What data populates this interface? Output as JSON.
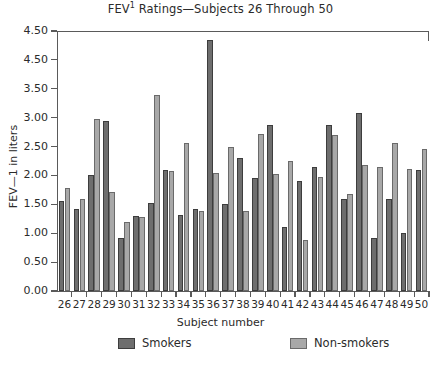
{
  "chart_data": {
    "type": "bar",
    "title_main": "FEV",
    "title_sup": "1",
    "title_rest": " Ratings—Subjects 26 Through 50",
    "xlabel": "Subject number",
    "ylabel": "FEV—1 in liters",
    "categories": [
      "26",
      "27",
      "28",
      "29",
      "30",
      "31",
      "32",
      "33",
      "34",
      "35",
      "36",
      "37",
      "38",
      "39",
      "40",
      "41",
      "42",
      "43",
      "44",
      "45",
      "46",
      "47",
      "48",
      "49",
      "50"
    ],
    "ylim": [
      0.0,
      4.5
    ],
    "ytick_values": [
      0.0,
      0.5,
      1.0,
      1.5,
      2.0,
      2.5,
      3.0,
      3.5,
      4.0,
      4.5
    ],
    "ytick_labels": [
      "0.00",
      "0.50",
      "1.00",
      "1.50",
      "2.00",
      "2.50",
      "3.00",
      "3.50",
      "4.50",
      "4.50"
    ],
    "grid": false,
    "legend_position": "bottom",
    "series": [
      {
        "name": "Smokers",
        "color": "#6e6e6e",
        "values": [
          1.55,
          1.42,
          2.0,
          2.95,
          0.92,
          1.3,
          1.53,
          2.1,
          1.32,
          1.42,
          4.35,
          1.5,
          2.3,
          1.95,
          2.88,
          1.1,
          1.9,
          2.15,
          2.88,
          1.6,
          3.08,
          0.92,
          1.6,
          1.0,
          2.1
        ]
      },
      {
        "name": "Non-smokers",
        "color": "#a8a8a8",
        "values": [
          1.78,
          1.6,
          2.97,
          1.72,
          1.2,
          1.28,
          3.4,
          2.08,
          2.57,
          1.38,
          2.05,
          2.5,
          1.38,
          2.72,
          2.02,
          2.25,
          0.88,
          1.98,
          2.7,
          1.68,
          2.18,
          2.15,
          2.57,
          2.12,
          2.45
        ]
      }
    ],
    "legend": [
      {
        "label": "Smokers",
        "color": "#6e6e6e"
      },
      {
        "label": "Non-smokers",
        "color": "#a8a8a8"
      }
    ]
  }
}
